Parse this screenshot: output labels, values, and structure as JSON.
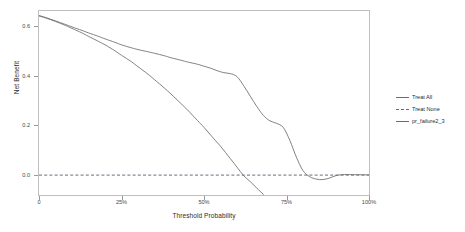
{
  "chart_data": {
    "type": "line",
    "title": "",
    "xlabel": "Threshold Probability",
    "ylabel": "Net Benefit",
    "xlim": [
      0,
      1
    ],
    "ylim": [
      -0.08,
      0.66
    ],
    "grid": false,
    "legend_position": "right",
    "x_ticks": [
      {
        "value": 0.0,
        "label": "0"
      },
      {
        "value": 0.25,
        "label": "25%"
      },
      {
        "value": 0.5,
        "label": "50%"
      },
      {
        "value": 0.75,
        "label": "75%"
      },
      {
        "value": 1.0,
        "label": "100%"
      }
    ],
    "y_ticks": [
      {
        "value": 0.0,
        "label": "0.0"
      },
      {
        "value": 0.2,
        "label": "0.2"
      },
      {
        "value": 0.4,
        "label": "0.4"
      },
      {
        "value": 0.6,
        "label": "0.6"
      }
    ],
    "series": [
      {
        "name": "Treat All",
        "style": "solid",
        "color": "#6b6b6b",
        "x": [
          0.0,
          0.02,
          0.05,
          0.08,
          0.1,
          0.13,
          0.15,
          0.18,
          0.2,
          0.23,
          0.25,
          0.28,
          0.3,
          0.33,
          0.35,
          0.38,
          0.4,
          0.43,
          0.45,
          0.48,
          0.5,
          0.53,
          0.55,
          0.58,
          0.6,
          0.62,
          0.64,
          0.66,
          0.68,
          0.69
        ],
        "y": [
          0.64,
          0.632,
          0.618,
          0.602,
          0.59,
          0.572,
          0.558,
          0.538,
          0.524,
          0.5,
          0.482,
          0.456,
          0.436,
          0.406,
          0.384,
          0.35,
          0.326,
          0.288,
          0.262,
          0.22,
          0.192,
          0.146,
          0.116,
          0.066,
          0.032,
          -0.002,
          -0.026,
          -0.052,
          -0.078,
          -0.092
        ]
      },
      {
        "name": "Treat None",
        "style": "dashed",
        "color": "#5a5a6e",
        "x": [
          0.0,
          1.0
        ],
        "y": [
          0.0,
          0.0
        ]
      },
      {
        "name": "pr_failure2_3",
        "style": "solid",
        "color": "#6b6b6b",
        "x": [
          0.0,
          0.02,
          0.05,
          0.08,
          0.1,
          0.13,
          0.15,
          0.18,
          0.2,
          0.23,
          0.25,
          0.28,
          0.3,
          0.33,
          0.35,
          0.38,
          0.4,
          0.43,
          0.45,
          0.48,
          0.5,
          0.52,
          0.54,
          0.56,
          0.58,
          0.6,
          0.62,
          0.64,
          0.66,
          0.68,
          0.7,
          0.72,
          0.74,
          0.76,
          0.78,
          0.8,
          0.82,
          0.84,
          0.86,
          0.88,
          0.9,
          0.92,
          0.95,
          1.0
        ],
        "y": [
          0.642,
          0.634,
          0.62,
          0.606,
          0.596,
          0.582,
          0.572,
          0.558,
          0.548,
          0.534,
          0.524,
          0.512,
          0.505,
          0.496,
          0.49,
          0.48,
          0.472,
          0.462,
          0.455,
          0.446,
          0.438,
          0.43,
          0.42,
          0.412,
          0.408,
          0.396,
          0.36,
          0.318,
          0.276,
          0.24,
          0.218,
          0.208,
          0.192,
          0.14,
          0.072,
          0.018,
          -0.006,
          -0.016,
          -0.018,
          -0.012,
          -0.002,
          0.002,
          0.002,
          0.001
        ]
      }
    ]
  },
  "legend": {
    "items": [
      {
        "label": "Treat All",
        "style": "solid"
      },
      {
        "label": "Treat None",
        "style": "dashed"
      },
      {
        "label": "pr_failure2_3",
        "style": "solid"
      }
    ]
  }
}
